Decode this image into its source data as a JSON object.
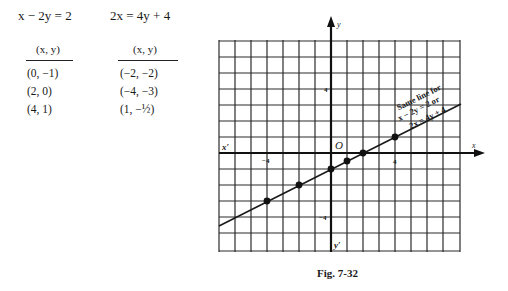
{
  "tables": [
    {
      "equation": "x − 2y = 2",
      "header": "(x, y)",
      "rows": [
        "(0, −1)",
        "(2, 0)",
        "(4, 1)"
      ]
    },
    {
      "equation": "2x = 4y + 4",
      "header": "(x, y)",
      "rows": [
        "(−2, −2)",
        "(−4, −3)",
        "(1, −½)"
      ]
    }
  ],
  "graph": {
    "origin_label": "O",
    "x_axis_label": "x",
    "x_neg_label": "x′",
    "y_axis_label": "y",
    "y_neg_label": "y′",
    "tick_labels": {
      "x_neg4": "−4",
      "x_pos4": "4",
      "y_pos4": "4",
      "y_neg4": "−4"
    },
    "annotation": {
      "line1": "Same line for",
      "line2": "x − 2y = 2   or",
      "line3": "2x = 4y + 4"
    },
    "points": [
      {
        "x": -4,
        "y": -3
      },
      {
        "x": -2,
        "y": -2
      },
      {
        "x": 0,
        "y": -1
      },
      {
        "x": 1,
        "y": -0.5
      },
      {
        "x": 2,
        "y": 0
      },
      {
        "x": 4,
        "y": 1
      }
    ],
    "line_color": "#1a1a1a",
    "grid_color": "#2a2a2a"
  },
  "caption": "Fig. 7-32"
}
